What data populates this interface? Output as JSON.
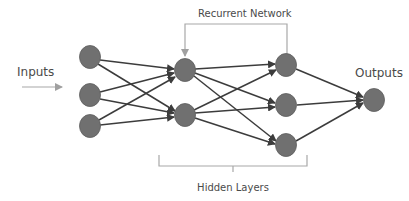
{
  "labels": {
    "inputs": "Inputs",
    "outputs": "Outputs",
    "recurrent": "Recurrent Network",
    "hidden": "Hidden Layers"
  },
  "colors": {
    "node": "#707070",
    "edge": "#3c3c3c",
    "annotation": "#a8a8a8",
    "text": "#4a4a4a"
  },
  "layers": [
    {
      "name": "input",
      "nodes": [
        {
          "x": 90,
          "y": 57
        },
        {
          "x": 90,
          "y": 95
        },
        {
          "x": 90,
          "y": 126
        }
      ]
    },
    {
      "name": "hidden-1",
      "nodes": [
        {
          "x": 185,
          "y": 70
        },
        {
          "x": 185,
          "y": 115
        }
      ]
    },
    {
      "name": "hidden-2",
      "nodes": [
        {
          "x": 286,
          "y": 65
        },
        {
          "x": 286,
          "y": 105
        },
        {
          "x": 286,
          "y": 145
        }
      ]
    },
    {
      "name": "output",
      "nodes": [
        {
          "x": 374,
          "y": 100
        }
      ]
    }
  ],
  "node_radius": {
    "rx": 10.5,
    "ry": 11.5
  }
}
